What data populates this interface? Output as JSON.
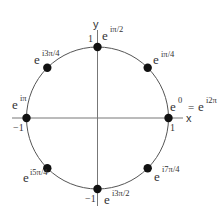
{
  "diagram": {
    "axes": {
      "x_label": "x",
      "y_label": "y"
    },
    "ticks": {
      "x_pos": "1",
      "x_neg": "−1",
      "y_pos": "1",
      "y_neg": "−1"
    },
    "points": [
      {
        "name": "e0",
        "base": "e",
        "exp": "0",
        "suffix_eq": "=",
        "suffix_base": "e",
        "suffix_exp": "i2π"
      },
      {
        "name": "e-ipi4",
        "base": "e",
        "exp": "iπ/4"
      },
      {
        "name": "e-ipi2",
        "base": "e",
        "exp": "iπ/2"
      },
      {
        "name": "e-i3pi4",
        "base": "e",
        "exp": "i3π/4"
      },
      {
        "name": "e-ipi",
        "base": "e",
        "exp": "iπ"
      },
      {
        "name": "e-i5pi4",
        "base": "e",
        "exp": "i5π/4"
      },
      {
        "name": "e-i3pi2",
        "base": "e",
        "exp": "i3π/2"
      },
      {
        "name": "e-i7pi4",
        "base": "e",
        "exp": "i7π/4"
      }
    ],
    "colors": {
      "stroke": "#555555",
      "point": "#111111",
      "text": "#333333"
    }
  }
}
